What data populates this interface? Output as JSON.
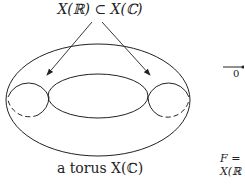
{
  "diagram": {
    "top_label": "X(ℝ) ⊂ X(ℂ)",
    "bottom_label": "a torus X(ℂ)",
    "right_panel": {
      "axis_origin_label": "0",
      "line1_label": "F =",
      "line2_label": "X(ℝ"
    },
    "stroke_color": "#222222",
    "background": "#ffffff"
  }
}
